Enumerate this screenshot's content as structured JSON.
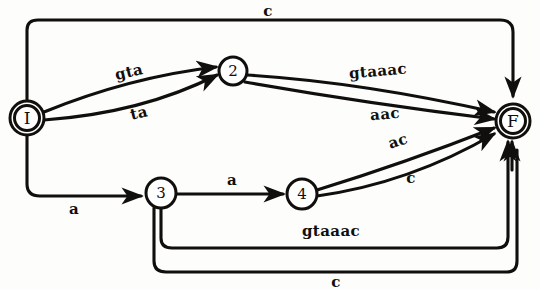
{
  "figure": {
    "type": "finite-state-automaton"
  },
  "nodes": [
    {
      "id": "I",
      "label": "I",
      "cx": 27,
      "cy": 118,
      "r": 17,
      "double": true,
      "role": "initial-state"
    },
    {
      "id": "2",
      "label": "2",
      "cx": 233,
      "cy": 71,
      "r": 14,
      "double": false,
      "role": "state"
    },
    {
      "id": "3",
      "label": "3",
      "cx": 161,
      "cy": 193,
      "r": 15,
      "double": false,
      "role": "state"
    },
    {
      "id": "4",
      "label": "4",
      "cx": 302,
      "cy": 194,
      "r": 15,
      "double": false,
      "role": "state"
    },
    {
      "id": "F",
      "label": "F",
      "cx": 513,
      "cy": 121,
      "r": 17,
      "double": true,
      "role": "final-state"
    }
  ],
  "edges": [
    {
      "from": "I",
      "to": "F",
      "label": "c",
      "route": "top-orthogonal",
      "label_x": 268,
      "label_y": 11,
      "label_rot": 0
    },
    {
      "from": "I",
      "to": "2",
      "label": "gta",
      "route": "curve-upper",
      "label_x": 129,
      "label_y": 72,
      "label_rot": -13
    },
    {
      "from": "I",
      "to": "2",
      "label": "ta",
      "route": "curve-lower",
      "label_x": 139,
      "label_y": 113,
      "label_rot": -13
    },
    {
      "from": "2",
      "to": "F",
      "label": "gtaaac",
      "route": "curve-upper",
      "label_x": 378,
      "label_y": 71,
      "label_rot": -5
    },
    {
      "from": "2",
      "to": "F",
      "label": "aac",
      "route": "curve-lower",
      "label_x": 385,
      "label_y": 114,
      "label_rot": -5
    },
    {
      "from": "I",
      "to": "3",
      "label": "a",
      "route": "left-orthogonal",
      "label_x": 74,
      "label_y": 209,
      "label_rot": 0
    },
    {
      "from": "3",
      "to": "4",
      "label": "a",
      "route": "straight",
      "label_x": 232,
      "label_y": 180,
      "label_rot": 0
    },
    {
      "from": "4",
      "to": "F",
      "label": "ac",
      "route": "curve-upper",
      "label_x": 398,
      "label_y": 141,
      "label_rot": -18
    },
    {
      "from": "4",
      "to": "F",
      "label": "c",
      "route": "curve-lower",
      "label_x": 411,
      "label_y": 178,
      "label_rot": 0
    },
    {
      "from": "3",
      "to": "F",
      "label": "gtaaac",
      "route": "bottom-inner",
      "label_x": 331,
      "label_y": 231,
      "label_rot": 0
    },
    {
      "from": "3",
      "to": "F",
      "label": "c",
      "route": "bottom-outer",
      "label_x": 336,
      "label_y": 282,
      "label_rot": 0
    }
  ],
  "colors": {
    "ink": "#100f0d",
    "paper": "#fdfdfb",
    "node_fill": "#ffffff"
  }
}
